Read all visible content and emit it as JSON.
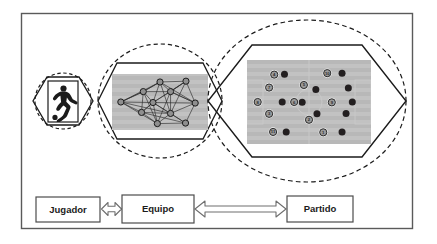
{
  "figure": {
    "frame": {
      "border_color": "#5a5a5a"
    },
    "colors": {
      "pitch": "#b8b8b8",
      "pitch_stripe": "#c2c2c2",
      "line": "#1b1b1b",
      "dashed": "#1b1b1b",
      "node_fill": "#8f8f8f",
      "dark_marker": "#231f20",
      "light_marker": "#9a9a9a",
      "marker_ring": "#f2f2f2",
      "box_fill": "#ffffff",
      "box_border": "#4c4c4c",
      "arrow_fill": "#ffffff",
      "arrow_border": "#6e6e6e",
      "player_silhouette": "#1b1b1b"
    }
  },
  "levels": [
    {
      "id": "jugador",
      "name": "player-level",
      "icon": "soccer-player-icon",
      "shape": "hexagon-in-dashed-circle",
      "cx": 63,
      "cy": 101,
      "rx": 29,
      "ry": 29
    },
    {
      "id": "equipo",
      "name": "team-level",
      "icon": "team-network-graph",
      "shape": "hexagon-in-dashed-ellipse",
      "cx": 160,
      "cy": 101,
      "rx": 63,
      "ry": 59
    },
    {
      "id": "partido",
      "name": "match-level",
      "icon": "match-pitch-players",
      "shape": "hexagon-in-dashed-ellipse",
      "cx": 307,
      "cy": 101,
      "rx": 100,
      "ry": 83
    }
  ],
  "team_graph": {
    "label": "team-network-graph",
    "node_count": 11,
    "nodes": [
      {
        "id": 1,
        "x": 0.5,
        "y": 0.115
      },
      {
        "id": 2,
        "x": 0.795,
        "y": 0.1
      },
      {
        "id": 3,
        "x": 0.31,
        "y": 0.3
      },
      {
        "id": 4,
        "x": 0.62,
        "y": 0.3
      },
      {
        "id": 5,
        "x": 0.055,
        "y": 0.5
      },
      {
        "id": 6,
        "x": 0.42,
        "y": 0.51
      },
      {
        "id": 7,
        "x": 0.9,
        "y": 0.52
      },
      {
        "id": 8,
        "x": 0.29,
        "y": 0.7
      },
      {
        "id": 9,
        "x": 0.62,
        "y": 0.72
      },
      {
        "id": 10,
        "x": 0.47,
        "y": 0.915
      },
      {
        "id": 11,
        "x": 0.79,
        "y": 0.905
      }
    ],
    "edges": [
      [
        1,
        2
      ],
      [
        1,
        3
      ],
      [
        1,
        4
      ],
      [
        1,
        6
      ],
      [
        1,
        5
      ],
      [
        1,
        7
      ],
      [
        2,
        4
      ],
      [
        2,
        7
      ],
      [
        2,
        6
      ],
      [
        3,
        4
      ],
      [
        3,
        5
      ],
      [
        3,
        6
      ],
      [
        3,
        8
      ],
      [
        3,
        1
      ],
      [
        4,
        6
      ],
      [
        4,
        7
      ],
      [
        4,
        9
      ],
      [
        4,
        2
      ],
      [
        5,
        6
      ],
      [
        5,
        8
      ],
      [
        5,
        3
      ],
      [
        5,
        10
      ],
      [
        6,
        7
      ],
      [
        6,
        8
      ],
      [
        6,
        9
      ],
      [
        6,
        10
      ],
      [
        6,
        11
      ],
      [
        7,
        9
      ],
      [
        7,
        11
      ],
      [
        7,
        4
      ],
      [
        8,
        9
      ],
      [
        8,
        10
      ],
      [
        8,
        6
      ],
      [
        9,
        10
      ],
      [
        9,
        11
      ],
      [
        10,
        11
      ],
      [
        2,
        9
      ],
      [
        5,
        9
      ],
      [
        3,
        10
      ],
      [
        4,
        10
      ],
      [
        8,
        11
      ],
      [
        1,
        9
      ]
    ]
  },
  "match_players": {
    "label": "match-player-markers",
    "team_a_label": "numbered-players",
    "team_b_label": "solid-players",
    "numbered": [
      {
        "n": "4",
        "x": 0.195,
        "y": 0.13
      },
      {
        "n": "10",
        "x": 0.66,
        "y": 0.11
      },
      {
        "n": "5",
        "x": 0.455,
        "y": 0.27
      },
      {
        "n": "7",
        "x": 0.15,
        "y": 0.305
      },
      {
        "n": "8",
        "x": 0.05,
        "y": 0.5
      },
      {
        "n": "6",
        "x": 0.37,
        "y": 0.5
      },
      {
        "n": "9",
        "x": 0.7,
        "y": 0.505
      },
      {
        "n": "3",
        "x": 0.15,
        "y": 0.66
      },
      {
        "n": "2",
        "x": 0.5,
        "y": 0.74
      },
      {
        "n": "11",
        "x": 0.185,
        "y": 0.905
      },
      {
        "n": "1",
        "x": 0.625,
        "y": 0.91
      }
    ],
    "solid": [
      {
        "x": 0.285,
        "y": 0.125
      },
      {
        "x": 0.79,
        "y": 0.11
      },
      {
        "x": 0.56,
        "y": 0.33
      },
      {
        "x": 0.845,
        "y": 0.31
      },
      {
        "x": 0.265,
        "y": 0.5
      },
      {
        "x": 0.44,
        "y": 0.505
      },
      {
        "x": 0.88,
        "y": 0.5
      },
      {
        "x": 0.57,
        "y": 0.66
      },
      {
        "x": 0.825,
        "y": 0.655
      },
      {
        "x": 0.3,
        "y": 0.905
      },
      {
        "x": 0.79,
        "y": 0.905
      }
    ]
  },
  "flow": {
    "nodes": [
      {
        "id": "jugador",
        "label": "Jugador",
        "x": 36,
        "y": 197,
        "w": 64,
        "h": 25
      },
      {
        "id": "equipo",
        "label": "Equipo",
        "x": 122,
        "y": 195,
        "w": 72,
        "h": 28
      },
      {
        "id": "partido",
        "label": "Partido",
        "x": 287,
        "y": 196,
        "w": 66,
        "h": 26
      }
    ],
    "connectors": [
      {
        "id": "jugador-equipo",
        "from": "Jugador",
        "to": "Equipo",
        "style": "double-headed-block-arrow"
      },
      {
        "id": "equipo-partido",
        "from": "Equipo",
        "to": "Partido",
        "style": "double-headed-block-arrow"
      }
    ]
  }
}
